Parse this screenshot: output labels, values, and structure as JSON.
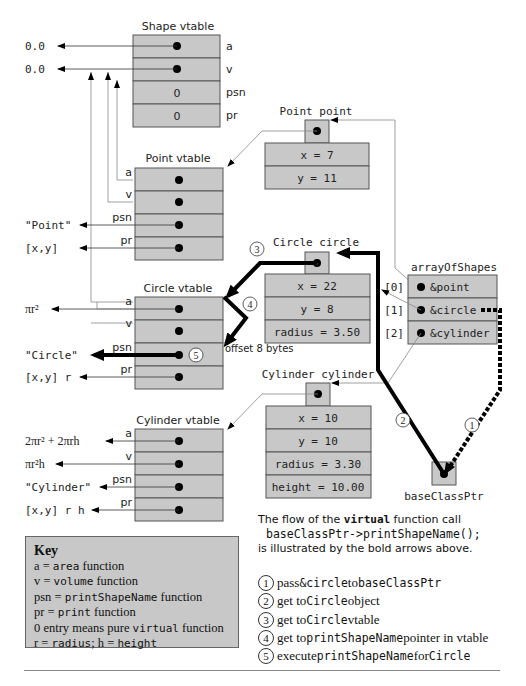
{
  "shape_vtable": {
    "title": "Shape vtable",
    "entries": [
      {
        "label": "a",
        "value": "",
        "target": "0.0"
      },
      {
        "label": "v",
        "value": "",
        "target": "0.0"
      },
      {
        "label": "psn",
        "value": "0"
      },
      {
        "label": "pr",
        "value": "0"
      }
    ]
  },
  "point_vtable": {
    "title": "Point vtable",
    "entries": [
      {
        "label": "a"
      },
      {
        "label": "v"
      },
      {
        "label": "psn",
        "target": "\"Point\""
      },
      {
        "label": "pr",
        "target": "[x,y]"
      }
    ]
  },
  "circle_vtable": {
    "title": "Circle vtable",
    "entries": [
      {
        "label": "a",
        "target": "πr²"
      },
      {
        "label": "v"
      },
      {
        "label": "psn",
        "target": "\"Circle\""
      },
      {
        "label": "pr",
        "target": "[x,y] r"
      }
    ],
    "offset_note": "offset 8 bytes"
  },
  "cylinder_vtable": {
    "title": "Cylinder vtable",
    "entries": [
      {
        "label": "a",
        "target": "2πr² + 2πrh"
      },
      {
        "label": "v",
        "target": "πr²h"
      },
      {
        "label": "psn",
        "target": "\"Cylinder\""
      },
      {
        "label": "pr",
        "target": "[x,y] r h"
      }
    ]
  },
  "point_object": {
    "title": "Point point",
    "fields": [
      "x = 7",
      "y = 11"
    ]
  },
  "circle_object": {
    "title": "Circle circle",
    "fields": [
      "x = 22",
      "y = 8",
      "radius = 3.50"
    ]
  },
  "cylinder_object": {
    "title": "Cylinder cylinder",
    "fields": [
      "x = 10",
      "y = 10",
      "radius = 3.30",
      "height = 10.00"
    ]
  },
  "array_of_shapes": {
    "title": "arrayOfShapes",
    "entries": [
      {
        "index": "[0]",
        "value": "&point"
      },
      {
        "index": "[1]",
        "value": "&circle"
      },
      {
        "index": "[2]",
        "value": "&cylinder"
      }
    ]
  },
  "base_class_ptr": {
    "label": "baseClassPtr"
  },
  "flow_markers": [
    "1",
    "2",
    "3",
    "4",
    "5"
  ],
  "key": {
    "title": "Key",
    "lines": [
      {
        "pre": "a = ",
        "mono": "area",
        "post": " function"
      },
      {
        "pre": "v = ",
        "mono": "volume",
        "post": " function"
      },
      {
        "pre": "psn = ",
        "mono": "printShapeName",
        "post": " function"
      },
      {
        "pre": "pr = ",
        "mono": "print",
        "post": " function"
      },
      {
        "pre": "0 entry means pure ",
        "mono": "virtual",
        "post": " function"
      },
      {
        "pre": "r = ",
        "mono": "radius",
        "post": "; h = ",
        "mono2": "height"
      }
    ]
  },
  "legend": {
    "intro_pre": "The flow of the ",
    "intro_mono": "virtual",
    "intro_post": " function call",
    "call": "baseClassPtr->printShapeName();",
    "intro_end": "is illustrated by the bold arrows above."
  },
  "steps": [
    {
      "num": "1",
      "pre": "pass ",
      "mono": "&circle",
      "mid": " to ",
      "mono2": "baseClassPtr",
      "post": ""
    },
    {
      "num": "2",
      "pre": "get to ",
      "mono": "Circle",
      "mid": " object",
      "mono2": "",
      "post": ""
    },
    {
      "num": "3",
      "pre": "get to ",
      "mono": "Circle",
      "mid": " vtable",
      "mono2": "",
      "post": ""
    },
    {
      "num": "4",
      "pre": "get to ",
      "mono": "printShapeName",
      "mid": " pointer in vtable",
      "mono2": "",
      "post": ""
    },
    {
      "num": "5",
      "pre": "execute ",
      "mono": "printShapeName",
      "mid": " for ",
      "mono2": "Circle",
      "post": ""
    }
  ]
}
